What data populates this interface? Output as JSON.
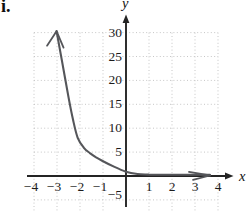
{
  "item_label": "i.",
  "chart_data": {
    "type": "line",
    "title": "",
    "xlabel": "x",
    "ylabel": "y",
    "x_ticks": [
      -4,
      -3,
      -2,
      -1,
      1,
      2,
      3,
      4
    ],
    "y_ticks": [
      30,
      25,
      20,
      15,
      10,
      5,
      -5
    ],
    "xlim": [
      -4.3,
      4.6
    ],
    "ylim": [
      -7,
      33
    ],
    "grid": true,
    "grid_style": "dotted",
    "legend": "none",
    "colors": {
      "curve": "#55565a",
      "axis": "#242424",
      "grid": "#c6c6c6",
      "text": "#1c1c1c",
      "background": "#ffffff"
    },
    "series": [
      {
        "name": "exponential-decay-curve",
        "description": "decreasing exponential curve approaching y=0 as x increases, rising toward +infinity as x decreases; arrowheads on both ends",
        "start_arrow": "up-left",
        "end_arrow": "right",
        "points": [
          [
            -3.02,
            30.3
          ],
          [
            -2.8,
            24.5
          ],
          [
            -2.5,
            16.5
          ],
          [
            -2.3,
            11.7
          ],
          [
            -2.1,
            8.0
          ],
          [
            -1.83,
            5.9
          ],
          [
            -1.57,
            4.8
          ],
          [
            -1.3,
            3.9
          ],
          [
            -1.04,
            3.2
          ],
          [
            -0.5,
            1.9
          ],
          [
            0,
            0.9
          ],
          [
            0.5,
            0.42
          ],
          [
            1,
            0.3
          ],
          [
            1.5,
            0.27
          ],
          [
            2,
            0.26
          ],
          [
            2.5,
            0.25
          ],
          [
            3,
            0.25
          ],
          [
            3.65,
            0.25
          ]
        ]
      }
    ]
  }
}
